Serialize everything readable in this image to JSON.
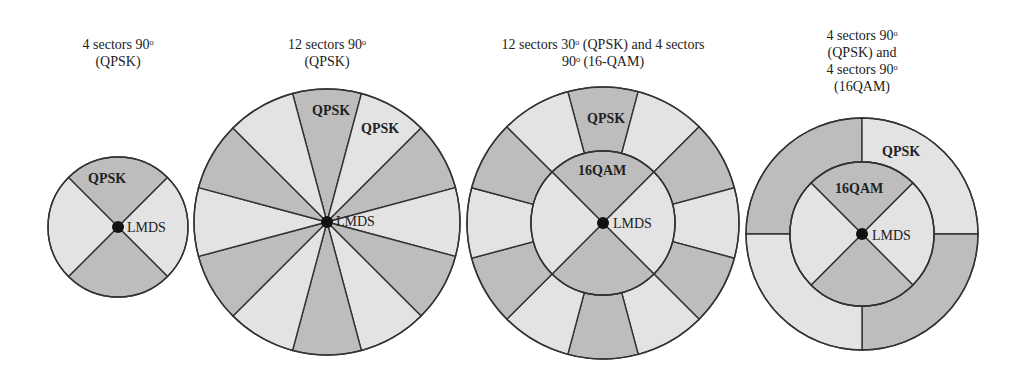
{
  "colors": {
    "dark": "#bdbdbd",
    "light": "#e3e3e3",
    "stroke": "#333333",
    "center": "#111111"
  },
  "diagrams": [
    {
      "title": "4 sectors 90ᵒ\n(QPSK)",
      "labels": {
        "outer": "QPSK",
        "center": "LMDS"
      }
    },
    {
      "title": "12 sectors 90ᵒ\n(QPSK)",
      "labels": {
        "outer": "QPSK",
        "outer2": "QPSK",
        "center": "LMDS"
      }
    },
    {
      "title": "12 sectors 30ᵒ (QPSK) and 4 sectors\n90ᵒ (16-QAM)",
      "labels": {
        "outer": "QPSK",
        "inner": "16QAM",
        "center": "LMDS"
      }
    },
    {
      "title": "4  sectors 90ᵒ\n(QPSK) and\n4 sectors 90ᵒ\n(16QAM)",
      "labels": {
        "outer": "QPSK",
        "inner": "16QAM",
        "center": "LMDS"
      }
    }
  ]
}
